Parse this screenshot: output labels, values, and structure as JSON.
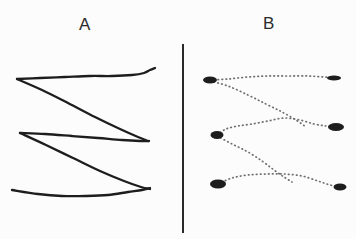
{
  "figure": {
    "background_color": "#fcfcfc",
    "ink_color": "#1d1d1d",
    "faint_ink_color": "#6f6f6f",
    "width": 356,
    "height": 239,
    "panels": [
      {
        "id": "A",
        "label": "A",
        "label_x": 88,
        "label_y": 28,
        "style": "solid",
        "description": "three chevron traces drawn as continuous dark lines"
      },
      {
        "id": "B",
        "label": "B",
        "label_x": 270,
        "label_y": 27,
        "style": "dotted",
        "description": "three chevron traces drawn as faint dotted point tracks with dark blobs at the vertices"
      }
    ],
    "divider": {
      "name": "vertical-divider",
      "x": 183,
      "y_top": 44,
      "y_bottom": 233,
      "width": 2,
      "color": "#2a2a2a"
    }
  },
  "chart_data": {
    "type": "line",
    "title": "",
    "xlabel": "",
    "ylabel": "",
    "grid": false,
    "legend": null,
    "panel_a": {
      "label": "A",
      "render": "solid-stroke",
      "series": [
        {
          "name": "trace-1-upper",
          "points": [
            [
              17,
              79
            ],
            [
              40,
              78
            ],
            [
              65,
              77
            ],
            [
              90,
              76
            ],
            [
              112,
              76
            ],
            [
              132,
              75
            ],
            [
              144,
              73
            ],
            [
              150,
              70
            ],
            [
              155,
              68
            ]
          ]
        },
        {
          "name": "trace-1-lower",
          "points": [
            [
              17,
              79
            ],
            [
              42,
              90
            ],
            [
              68,
              103
            ],
            [
              95,
              117
            ],
            [
              120,
              129
            ],
            [
              138,
              137
            ],
            [
              148,
              141
            ]
          ]
        },
        {
          "name": "trace-2-upper",
          "points": [
            [
              20,
              133
            ],
            [
              45,
              134
            ],
            [
              72,
              136
            ],
            [
              98,
              138
            ],
            [
              122,
              140
            ],
            [
              140,
              141
            ],
            [
              149,
              141
            ]
          ]
        },
        {
          "name": "trace-2-lower",
          "points": [
            [
              20,
              133
            ],
            [
              46,
              145
            ],
            [
              73,
              158
            ],
            [
              100,
              171
            ],
            [
              124,
              181
            ],
            [
              141,
              187
            ],
            [
              150,
              189
            ]
          ]
        },
        {
          "name": "trace-3",
          "points": [
            [
              12,
              190
            ],
            [
              38,
              194
            ],
            [
              62,
              196
            ],
            [
              86,
              196
            ],
            [
              108,
              195
            ],
            [
              128,
              192
            ],
            [
              142,
              190
            ],
            [
              150,
              188
            ]
          ]
        }
      ],
      "xlim": [
        0,
        178
      ],
      "ylim": [
        239,
        0
      ]
    },
    "panel_b": {
      "label": "B",
      "render": "dotted-points-with-blobs",
      "series": [
        {
          "name": "trace-1-upper",
          "points": [
            [
              210,
              80
            ],
            [
              228,
              79
            ],
            [
              248,
              77
            ],
            [
              268,
              76
            ],
            [
              288,
              76
            ],
            [
              308,
              76
            ],
            [
              324,
              77
            ],
            [
              334,
              78
            ]
          ]
        },
        {
          "name": "trace-1-lower",
          "points": [
            [
              210,
              81
            ],
            [
              228,
              86
            ],
            [
              248,
              95
            ],
            [
              266,
              104
            ],
            [
              282,
              112
            ],
            [
              296,
              120
            ],
            [
              306,
              127
            ]
          ]
        },
        {
          "name": "trace-2-upper",
          "points": [
            [
              217,
              135
            ],
            [
              226,
              129
            ],
            [
              238,
              126
            ],
            [
              252,
              124
            ],
            [
              268,
              121
            ],
            [
              284,
              118
            ],
            [
              300,
              120
            ],
            [
              314,
              124
            ],
            [
              326,
              126
            ],
            [
              336,
              127
            ]
          ]
        },
        {
          "name": "trace-2-lower",
          "points": [
            [
              217,
              136
            ],
            [
              232,
              144
            ],
            [
              248,
              152
            ],
            [
              262,
              161
            ],
            [
              274,
              170
            ],
            [
              284,
              177
            ],
            [
              292,
              182
            ]
          ]
        },
        {
          "name": "trace-3",
          "points": [
            [
              218,
              184
            ],
            [
              232,
              178
            ],
            [
              248,
              175
            ],
            [
              266,
              174
            ],
            [
              284,
              174
            ],
            [
              302,
              176
            ],
            [
              318,
              181
            ],
            [
              330,
              185
            ],
            [
              340,
              187
            ]
          ]
        }
      ],
      "blobs": [
        {
          "x": 210,
          "y": 80,
          "rx": 7,
          "ry": 3.5
        },
        {
          "x": 334,
          "y": 78,
          "rx": 7,
          "ry": 2.5
        },
        {
          "x": 217,
          "y": 135,
          "rx": 6.5,
          "ry": 4
        },
        {
          "x": 336,
          "y": 127,
          "rx": 8,
          "ry": 4
        },
        {
          "x": 218,
          "y": 184,
          "rx": 8,
          "ry": 4.5
        },
        {
          "x": 340,
          "y": 187,
          "rx": 6.5,
          "ry": 3.5
        }
      ],
      "xlim": [
        178,
        356
      ],
      "ylim": [
        239,
        0
      ]
    }
  }
}
